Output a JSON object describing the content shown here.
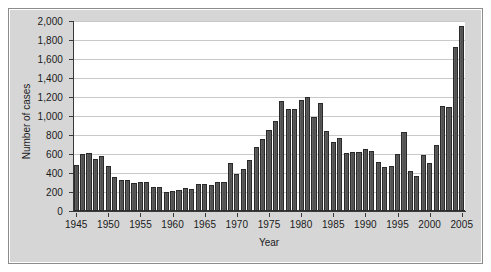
{
  "chart_data": {
    "type": "bar",
    "title": "",
    "xlabel": "Year",
    "ylabel": "Number of cases",
    "ylim": [
      0,
      2000
    ],
    "y_ticks": [
      0,
      200,
      400,
      600,
      800,
      1000,
      1200,
      1400,
      1600,
      1800,
      2000
    ],
    "y_tick_labels": [
      "0",
      "200",
      "400",
      "600",
      "800",
      "1,000",
      "1,200",
      "1,400",
      "1,600",
      "1,800",
      "2,000"
    ],
    "x_tick_labels": [
      "1945",
      "1950",
      "1955",
      "1960",
      "1965",
      "1970",
      "1975",
      "1980",
      "1985",
      "1990",
      "1995",
      "2000",
      "2005"
    ],
    "grid": true,
    "legend": false,
    "bar_color": "#555555",
    "bar_edge_color": "#2a2a2a",
    "plot_background": "#ffffff",
    "panel_background": "#d6d6d6",
    "gridline_color": "#c9c9c9",
    "axis_color": "#3a3a3a",
    "categories": [
      "1945",
      "1946",
      "1947",
      "1948",
      "1949",
      "1950",
      "1951",
      "1952",
      "1953",
      "1954",
      "1955",
      "1956",
      "1957",
      "1958",
      "1959",
      "1960",
      "1961",
      "1962",
      "1963",
      "1964",
      "1965",
      "1966",
      "1967",
      "1968",
      "1969",
      "1970",
      "1971",
      "1972",
      "1973",
      "1974",
      "1975",
      "1976",
      "1977",
      "1978",
      "1979",
      "1980",
      "1981",
      "1982",
      "1983",
      "1984",
      "1985",
      "1986",
      "1987",
      "1988",
      "1989",
      "1990",
      "1991",
      "1992",
      "1993",
      "1994",
      "1995",
      "1996",
      "1997",
      "1998",
      "1999",
      "2000",
      "2001",
      "2002",
      "2003",
      "2004",
      "2005"
    ],
    "values": [
      480,
      600,
      610,
      550,
      580,
      470,
      355,
      330,
      325,
      300,
      305,
      305,
      250,
      250,
      205,
      215,
      225,
      245,
      235,
      280,
      285,
      270,
      310,
      305,
      505,
      390,
      440,
      535,
      675,
      760,
      850,
      945,
      1160,
      1070,
      1075,
      1170,
      1195,
      985,
      1135,
      840,
      725,
      770,
      615,
      620,
      625,
      650,
      635,
      520,
      465,
      470,
      595,
      835,
      420,
      370,
      590,
      505,
      700,
      1110,
      1095,
      1725,
      1950
    ]
  }
}
